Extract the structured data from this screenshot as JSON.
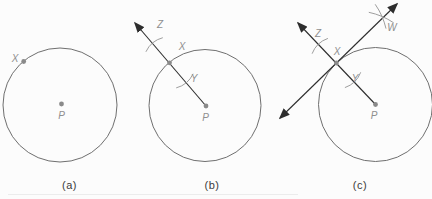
{
  "figure": {
    "background": "#fcfcfc",
    "colors": {
      "circle_stroke": "#6f6f6f",
      "line_stroke": "#2d2d2d",
      "dot_fill": "#8a8a8a",
      "point_label": "#8f8f8f",
      "caption": "#3b3b3b",
      "arc_stroke": "#9e9e9e",
      "artifact_line": "#ececec"
    },
    "panels": [
      {
        "id": "a",
        "caption": "(a)",
        "caption_x": 69.5,
        "caption_y": 189,
        "circle": {
          "cx": 60,
          "cy": 105,
          "r": 57
        },
        "dots": [
          {
            "name": "X",
            "x": 23.7,
            "y": 61.5
          },
          {
            "name": "P",
            "x": 61.5,
            "y": 104
          }
        ],
        "labels": [
          {
            "text": "X",
            "x": 15,
            "y": 62
          },
          {
            "text": "P",
            "x": 61.5,
            "y": 119
          }
        ],
        "rays": [],
        "arc_marks": []
      },
      {
        "id": "b",
        "caption": "(b)",
        "caption_x": 212,
        "caption_y": 189,
        "circle": {
          "cx": 205,
          "cy": 105.5,
          "r": 56
        },
        "dots": [
          {
            "name": "X",
            "x": 169.5,
            "y": 62.8
          },
          {
            "name": "P",
            "x": 206,
            "y": 106
          }
        ],
        "labels": [
          {
            "text": "Z",
            "x": 160,
            "y": 28
          },
          {
            "text": "X",
            "x": 182,
            "y": 50
          },
          {
            "text": "Y",
            "x": 194,
            "y": 82
          },
          {
            "text": "P",
            "x": 205.5,
            "y": 121
          }
        ],
        "rays": [
          {
            "x1": 206,
            "y1": 106,
            "x2": 135,
            "y2": 23,
            "arrow_start": false,
            "arrow_end": true
          }
        ],
        "arc_marks": [
          {
            "cx": 169.5,
            "cy": 62.8,
            "r": 26,
            "a1": 25,
            "a2": 75
          },
          {
            "cx": 169.5,
            "cy": 62.8,
            "r": 26,
            "a1": 205,
            "a2": 255
          }
        ]
      },
      {
        "id": "c",
        "caption": "(c)",
        "caption_x": 360,
        "caption_y": 189,
        "circle": {
          "cx": 375.5,
          "cy": 104.5,
          "r": 57
        },
        "dots": [
          {
            "name": "X",
            "x": 336.4,
            "y": 63
          },
          {
            "name": "P",
            "x": 375.5,
            "y": 104.5
          }
        ],
        "labels": [
          {
            "text": "Z",
            "x": 318,
            "y": 37
          },
          {
            "text": "X",
            "x": 337,
            "y": 55
          },
          {
            "text": "Y",
            "x": 355,
            "y": 82
          },
          {
            "text": "W",
            "x": 392,
            "y": 31
          },
          {
            "text": "P",
            "x": 374,
            "y": 119
          }
        ],
        "rays": [
          {
            "x1": 375.5,
            "y1": 104.5,
            "x2": 298,
            "y2": 23,
            "arrow_start": false,
            "arrow_end": true
          },
          {
            "x1": 280,
            "y1": 118,
            "x2": 397,
            "y2": 4,
            "arrow_start": true,
            "arrow_end": true
          }
        ],
        "arc_marks": [
          {
            "cx": 336.4,
            "cy": 63,
            "r": 26,
            "a1": 21,
            "a2": 71
          },
          {
            "cx": 336.4,
            "cy": 63,
            "r": 26,
            "a1": 201,
            "a2": 251
          },
          {
            "cx": 354,
            "cy": 81.7,
            "r": 71,
            "a1": -78,
            "a2": -56
          },
          {
            "cx": 318,
            "cy": 44.3,
            "r": 69.8,
            "a1": -35,
            "a2": -13
          }
        ]
      }
    ],
    "artifact": {
      "x1": 8,
      "y1": 194.5,
      "x2": 298,
      "y2": 194.5
    }
  }
}
